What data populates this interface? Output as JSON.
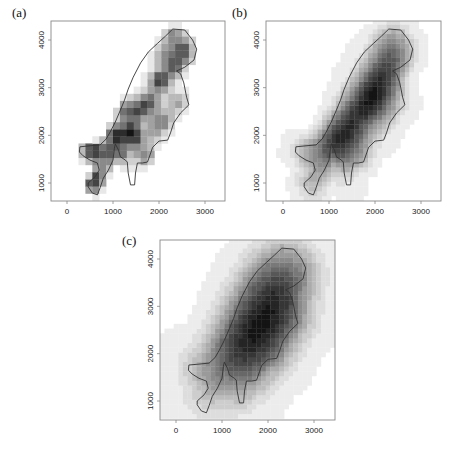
{
  "chart_data": [
    {
      "type": "heatmap",
      "panel_label": "(a)",
      "title": "",
      "xlabel": "",
      "ylabel": "",
      "xlim": [
        -350,
        3450
      ],
      "ylim": [
        630,
        4400
      ],
      "xticks": [
        0,
        1000,
        2000,
        3000
      ],
      "xtick_labels": [
        "0",
        "1000",
        "2000",
        "3000"
      ],
      "yticks": [
        1000,
        2000,
        3000,
        4000
      ],
      "ytick_labels": [
        "1000",
        "2000",
        "3000",
        "4000"
      ],
      "grid": false,
      "cell_size": 150,
      "smoothing": 160,
      "clip_to_outline_buffer": 120,
      "hotspots": [
        {
          "x": 2030,
          "y": 3160,
          "w": 1.0
        },
        {
          "x": 2360,
          "y": 3470,
          "w": 0.75
        },
        {
          "x": 2540,
          "y": 3790,
          "w": 0.8
        },
        {
          "x": 2300,
          "y": 4100,
          "w": 0.6
        },
        {
          "x": 2100,
          "y": 3700,
          "w": 0.5
        },
        {
          "x": 1050,
          "y": 2000,
          "w": 0.95
        },
        {
          "x": 1090,
          "y": 1590,
          "w": 0.95
        },
        {
          "x": 1380,
          "y": 2110,
          "w": 0.8
        },
        {
          "x": 1600,
          "y": 2530,
          "w": 0.75
        },
        {
          "x": 1270,
          "y": 2530,
          "w": 0.6
        },
        {
          "x": 1820,
          "y": 2740,
          "w": 0.7
        },
        {
          "x": 500,
          "y": 1700,
          "w": 0.7
        },
        {
          "x": 720,
          "y": 1650,
          "w": 0.55
        },
        {
          "x": 550,
          "y": 1000,
          "w": 0.9
        },
        {
          "x": 700,
          "y": 1250,
          "w": 0.5
        },
        {
          "x": 1710,
          "y": 1550,
          "w": 0.6
        },
        {
          "x": 2100,
          "y": 2320,
          "w": 0.55
        },
        {
          "x": 2400,
          "y": 2700,
          "w": 0.45
        },
        {
          "x": 1500,
          "y": 1900,
          "w": 0.6
        },
        {
          "x": 1900,
          "y": 2100,
          "w": 0.4
        }
      ]
    },
    {
      "type": "heatmap",
      "panel_label": "(b)",
      "title": "",
      "xlabel": "",
      "ylabel": "",
      "xlim": [
        -350,
        3450
      ],
      "ylim": [
        630,
        4400
      ],
      "xticks": [
        0,
        1000,
        2000,
        3000
      ],
      "xtick_labels": [
        "0",
        "1000",
        "2000",
        "3000"
      ],
      "yticks": [
        1000,
        2000,
        3000,
        4000
      ],
      "ytick_labels": [
        "1000",
        "2000",
        "3000",
        "4000"
      ],
      "grid": false,
      "cell_size": 100,
      "smoothing": 330,
      "clip_to_outline_buffer": 380,
      "hotspots": [
        {
          "x": 2050,
          "y": 3050,
          "w": 1.0
        },
        {
          "x": 2250,
          "y": 3400,
          "w": 0.85
        },
        {
          "x": 2450,
          "y": 3750,
          "w": 0.6
        },
        {
          "x": 2350,
          "y": 4050,
          "w": 0.45
        },
        {
          "x": 1200,
          "y": 1950,
          "w": 1.0
        },
        {
          "x": 1450,
          "y": 2200,
          "w": 0.85
        },
        {
          "x": 1700,
          "y": 2550,
          "w": 0.85
        },
        {
          "x": 1900,
          "y": 2750,
          "w": 0.7
        },
        {
          "x": 600,
          "y": 1700,
          "w": 0.6
        },
        {
          "x": 650,
          "y": 1000,
          "w": 0.55
        },
        {
          "x": 1100,
          "y": 1550,
          "w": 0.6
        },
        {
          "x": 1650,
          "y": 1550,
          "w": 0.5
        },
        {
          "x": 2300,
          "y": 2500,
          "w": 0.35
        }
      ]
    },
    {
      "type": "heatmap",
      "panel_label": "(c)",
      "title": "",
      "xlabel": "",
      "ylabel": "",
      "xlim": [
        -350,
        3450
      ],
      "ylim": [
        630,
        4400
      ],
      "xticks": [
        0,
        1000,
        2000,
        3000
      ],
      "xtick_labels": [
        "0",
        "1000",
        "2000",
        "3000"
      ],
      "yticks": [
        1000,
        2000,
        3000,
        4000
      ],
      "ytick_labels": [
        "1000",
        "2000",
        "3000",
        "4000"
      ],
      "grid": false,
      "cell_size": 100,
      "smoothing": 620,
      "clip_to_outline_buffer": 900,
      "hotspots": [
        {
          "x": 1500,
          "y": 2050,
          "w": 1.0
        },
        {
          "x": 1800,
          "y": 2500,
          "w": 1.0
        },
        {
          "x": 2100,
          "y": 3000,
          "w": 1.0
        },
        {
          "x": 2300,
          "y": 3500,
          "w": 0.8
        },
        {
          "x": 2400,
          "y": 3900,
          "w": 0.5
        },
        {
          "x": 1100,
          "y": 1700,
          "w": 0.6
        },
        {
          "x": 700,
          "y": 1300,
          "w": 0.35
        }
      ]
    }
  ],
  "outline": [
    [
      2300,
      4230
    ],
    [
      2560,
      4210
    ],
    [
      2730,
      4000
    ],
    [
      2820,
      3810
    ],
    [
      2760,
      3580
    ],
    [
      2560,
      3430
    ],
    [
      2380,
      3350
    ],
    [
      2470,
      3290
    ],
    [
      2540,
      3100
    ],
    [
      2600,
      2800
    ],
    [
      2650,
      2640
    ],
    [
      2470,
      2470
    ],
    [
      2320,
      2260
    ],
    [
      2250,
      2050
    ],
    [
      2190,
      1900
    ],
    [
      2000,
      1880
    ],
    [
      1860,
      1750
    ],
    [
      1820,
      1630
    ],
    [
      1750,
      1440
    ],
    [
      1640,
      1420
    ],
    [
      1530,
      1420
    ],
    [
      1490,
      1210
    ],
    [
      1470,
      960
    ],
    [
      1380,
      960
    ],
    [
      1330,
      1210
    ],
    [
      1310,
      1440
    ],
    [
      1270,
      1480
    ],
    [
      1160,
      1550
    ],
    [
      1120,
      1690
    ],
    [
      1050,
      1820
    ],
    [
      1030,
      1730
    ],
    [
      1000,
      1480
    ],
    [
      900,
      1270
    ],
    [
      790,
      1100
    ],
    [
      720,
      900
    ],
    [
      660,
      750
    ],
    [
      550,
      790
    ],
    [
      460,
      920
    ],
    [
      460,
      1000
    ],
    [
      610,
      1130
    ],
    [
      700,
      1270
    ],
    [
      660,
      1420
    ],
    [
      500,
      1480
    ],
    [
      350,
      1570
    ],
    [
      270,
      1650
    ],
    [
      280,
      1760
    ],
    [
      500,
      1780
    ],
    [
      720,
      1800
    ],
    [
      850,
      1920
    ],
    [
      940,
      2070
    ],
    [
      1050,
      2280
    ],
    [
      1160,
      2530
    ],
    [
      1250,
      2740
    ],
    [
      1330,
      2970
    ],
    [
      1440,
      3220
    ],
    [
      1600,
      3520
    ],
    [
      1770,
      3750
    ],
    [
      1970,
      3930
    ],
    [
      2140,
      4080
    ]
  ],
  "layout": {
    "panels": [
      {
        "left": 51,
        "top": 21,
        "width": 174,
        "height": 180,
        "x0px": 67,
        "x3000px": 205,
        "y1000px": 183,
        "y4000px": 40
      },
      {
        "left": 266,
        "top": 21,
        "width": 175,
        "height": 180,
        "x0px": 283,
        "x3000px": 421,
        "y1000px": 183,
        "y4000px": 40
      },
      {
        "left": 160,
        "top": 240,
        "width": 175,
        "height": 180,
        "x0px": 176,
        "x3000px": 314,
        "y1000px": 401,
        "y4000px": 259
      }
    ],
    "label_offsets": [
      [
        12,
        6
      ],
      [
        232,
        6
      ],
      [
        120,
        235
      ]
    ]
  }
}
